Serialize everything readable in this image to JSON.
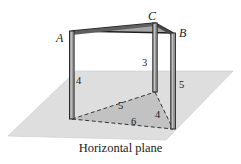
{
  "figure": {
    "caption": "Horizontal plane",
    "vertices": [
      {
        "id": "A",
        "label": "A",
        "x": 58,
        "y": 38
      },
      {
        "id": "C",
        "label": "C",
        "x": 150,
        "y": 17
      },
      {
        "id": "B",
        "label": "B",
        "x": 181,
        "y": 34
      }
    ],
    "measurements": [
      {
        "id": "post-a-height",
        "label": "4",
        "x": 76,
        "y": 78
      },
      {
        "id": "post-c-height",
        "label": "3",
        "x": 141,
        "y": 60
      },
      {
        "id": "post-b-height",
        "label": "5",
        "x": 180,
        "y": 84
      },
      {
        "id": "base-side-left",
        "label": "5",
        "x": 117,
        "y": 104
      },
      {
        "id": "base-side-right",
        "label": "4",
        "x": 156,
        "y": 113
      },
      {
        "id": "base-side-front",
        "label": "6",
        "x": 131,
        "y": 119
      }
    ],
    "colors": {
      "plane_fill": "#dedede",
      "plane_edge": "#cfcfcf",
      "top_face_fill": "#a9a9a9",
      "base_triangle_fill": "#bdbdbd",
      "post_light": "#8f8f8f",
      "post_dark": "#555555",
      "outline": "#1f1f1f",
      "dashed_line": "#3a3a3a",
      "background": "#ffffff"
    },
    "geometry": {
      "plane_polygon": "8,136 76,71 233,71 166,140",
      "top_triangle": "72,31 155,23 173,33",
      "base_triangle": "72,119 155,92 173,129",
      "post_a": {
        "x_top": 72,
        "y_top": 31,
        "x_bottom": 72,
        "y_bottom": 119,
        "height_label": "4"
      },
      "post_c": {
        "x_top": 155,
        "y_top": 23,
        "x_bottom": 155,
        "y_bottom": 92,
        "height_label": "3"
      },
      "post_b": {
        "x_top": 173,
        "y_top": 33,
        "x_bottom": 173,
        "y_bottom": 129,
        "height_label": "5"
      }
    }
  }
}
